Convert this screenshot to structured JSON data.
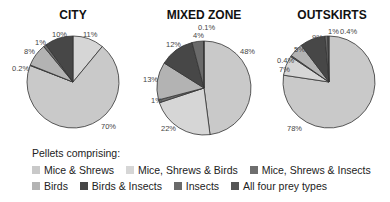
{
  "chart_data": [
    {
      "type": "pie",
      "title": "CITY",
      "slices": [
        {
          "label": "Mice, Shrews & Birds",
          "value": 11,
          "display": "11%"
        },
        {
          "label": "Mice & Shrews",
          "value": 70,
          "display": "70%"
        },
        {
          "label": "Mice, Shrews & Insects",
          "value": 0.2,
          "display": "0.2%"
        },
        {
          "label": "Birds",
          "value": 8,
          "display": "8%"
        },
        {
          "label": "Insects",
          "value": 1,
          "display": "1%"
        },
        {
          "label": "Birds & Insects",
          "value": 10,
          "display": "10%"
        }
      ]
    },
    {
      "type": "pie",
      "title": "MIXED ZONE",
      "slices": [
        {
          "label": "Mice & Shrews",
          "value": 48,
          "display": "48%"
        },
        {
          "label": "Mice, Shrews & Birds",
          "value": 22,
          "display": "22%"
        },
        {
          "label": "Mice, Shrews & Insects",
          "value": 1,
          "display": "1%"
        },
        {
          "label": "Birds",
          "value": 13,
          "display": "13%"
        },
        {
          "label": "Birds & Insects",
          "value": 12,
          "display": "12%"
        },
        {
          "label": "Insects",
          "value": 4,
          "display": "4%"
        },
        {
          "label": "All four prey types",
          "value": 0.1,
          "display": "0.1%"
        }
      ]
    },
    {
      "type": "pie",
      "title": "OUTSKIRTS",
      "slices": [
        {
          "label": "Mice & Shrews",
          "value": 78,
          "display": "78%"
        },
        {
          "label": "Mice, Shrews & Birds",
          "value": 7,
          "display": "7%"
        },
        {
          "label": "Mice, Shrews & Insects",
          "value": 0.4,
          "display": "0.4%"
        },
        {
          "label": "Birds",
          "value": 5,
          "display": "5%"
        },
        {
          "label": "Birds & Insects",
          "value": 9,
          "display": "9%"
        },
        {
          "label": "Insects",
          "value": 1,
          "display": "1%"
        },
        {
          "label": "All four prey types",
          "value": 0.4,
          "display": "0.4%"
        }
      ]
    }
  ],
  "legend": {
    "title": "Pellets comprising:",
    "items": [
      {
        "label": "Mice & Shrews",
        "color": "#c9c9c9"
      },
      {
        "label": "Mice, Shrews & Birds",
        "color": "#d6d6d6"
      },
      {
        "label": "Mice, Shrews & Insects",
        "color": "#6e6e6e"
      },
      {
        "label": "Birds",
        "color": "#b3b3b3"
      },
      {
        "label": "Birds & Insects",
        "color": "#474747"
      },
      {
        "label": "Insects",
        "color": "#6a6a6a"
      },
      {
        "label": "All four prey types",
        "color": "#555555"
      }
    ]
  }
}
